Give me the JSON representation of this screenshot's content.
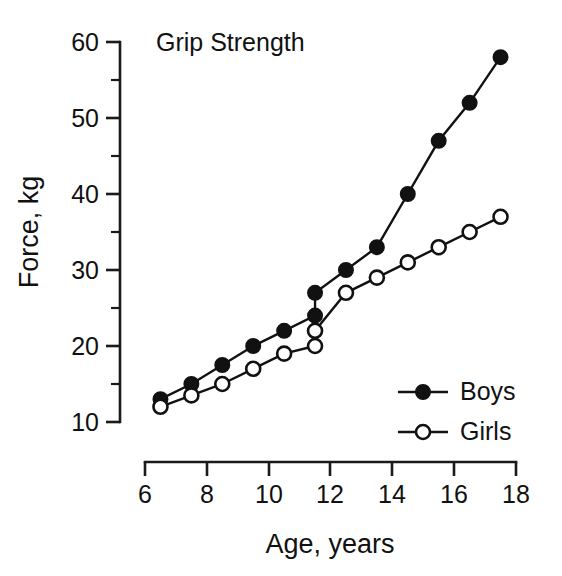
{
  "chart_data": {
    "type": "line",
    "title": "Grip Strength",
    "xlabel": "Age, years",
    "ylabel": "Force, kg",
    "xlim": [
      6,
      18
    ],
    "ylim": [
      10,
      60
    ],
    "xticks": [
      6,
      8,
      10,
      12,
      14,
      16,
      18
    ],
    "xtick_labels": [
      "6",
      "8",
      "10",
      "12",
      "14",
      "16",
      "18"
    ],
    "yticks": [
      10,
      20,
      30,
      40,
      50,
      60
    ],
    "ytick_labels": [
      "10",
      "20",
      "30",
      "40",
      "50",
      "60"
    ],
    "yticks_minor": [
      15,
      25,
      35,
      45,
      55
    ],
    "grid": false,
    "legend_position": "lower-right",
    "series": [
      {
        "name": "Boys",
        "marker": "filled-circle",
        "x": [
          6.5,
          7.5,
          8.5,
          9.5,
          10.5,
          11.5,
          11.5,
          12.5,
          13.5,
          14.5,
          15.5,
          16.5,
          17.5
        ],
        "y": [
          13,
          15,
          17.5,
          20,
          22,
          24,
          27,
          30,
          33,
          40,
          47,
          52,
          58
        ]
      },
      {
        "name": "Girls",
        "marker": "open-circle",
        "x": [
          6.5,
          7.5,
          8.5,
          9.5,
          10.5,
          11.5,
          11.5,
          12.5,
          13.5,
          14.5,
          15.5,
          16.5,
          17.5
        ],
        "y": [
          12,
          13.5,
          15,
          17,
          19,
          20,
          22,
          27,
          29,
          31,
          33,
          35,
          37
        ]
      }
    ]
  },
  "legend": {
    "entries": [
      {
        "label": "Boys",
        "marker": "filled-circle"
      },
      {
        "label": "Girls",
        "marker": "open-circle"
      }
    ]
  },
  "colors": {
    "ink": "#111111",
    "background": "#ffffff"
  }
}
